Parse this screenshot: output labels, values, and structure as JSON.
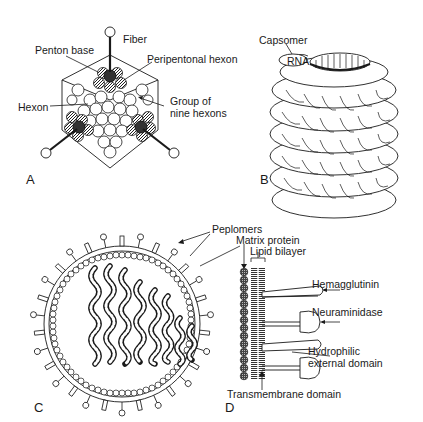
{
  "figure": {
    "panels": [
      {
        "id": "A",
        "letter": "A",
        "subject": "icosahedral virion (adenovirus)",
        "labels": {
          "fiber": "Fiber",
          "penton_base": "Penton base",
          "peripentonal_hexon": "Peripentonal hexon",
          "hexon": "Hexon",
          "group_line1": "Group of",
          "group_line2": "nine hexons"
        }
      },
      {
        "id": "B",
        "letter": "B",
        "subject": "helical nucleocapsid",
        "labels": {
          "capsomer": "Capsomer",
          "rna": "RNA"
        }
      },
      {
        "id": "C",
        "letter": "C",
        "subject": "enveloped virion (influenza) cross-section",
        "labels": {}
      },
      {
        "id": "D",
        "letter": "D",
        "subject": "envelope detail",
        "labels": {
          "peplomers": "Peplomers",
          "matrix_protein": "Matrix protein",
          "lipid_bilayer": "Lipid bilayer",
          "hemagglutinin": "Hemagglutinin",
          "neuraminidase": "Neuraminidase",
          "hydrophilic_line1": "Hydrophilic",
          "hydrophilic_line2": "external domain",
          "transmembrane": "Transmembrane domain"
        }
      }
    ]
  },
  "colors": {
    "ink": "#1a1a1a",
    "background": "#ffffff",
    "hatch": "#555555"
  }
}
